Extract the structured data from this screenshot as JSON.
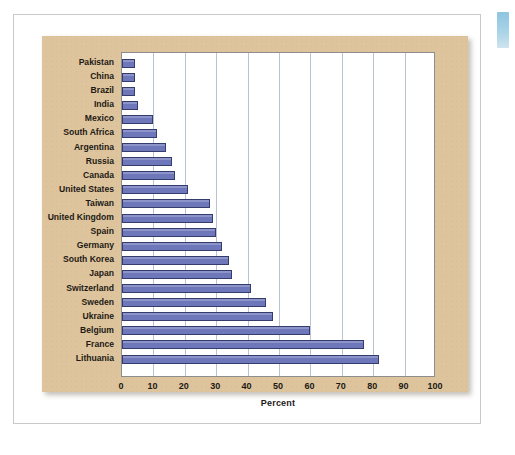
{
  "page": {
    "edge_tab_name": "page-edge-tab",
    "panel_color": "#ddc49c",
    "bar_color": "#6e77ba",
    "bar_border_color": "#343c6e",
    "gridline_color": "#b9c3d4",
    "plot_background": "#ffffff"
  },
  "chart_data": {
    "type": "bar",
    "orientation": "horizontal",
    "title": "",
    "subtitle": "",
    "xlabel": "Percent",
    "ylabel": "",
    "xlim": [
      0,
      100
    ],
    "xticks": [
      0,
      10,
      20,
      30,
      40,
      50,
      60,
      70,
      80,
      90,
      100
    ],
    "xtick_labels": [
      "0",
      "10",
      "20",
      "30",
      "40",
      "50",
      "60",
      "70",
      "80",
      "90",
      "100"
    ],
    "grid": "vertical",
    "legend": "none",
    "categories": [
      "Pakistan",
      "China",
      "Brazil",
      "India",
      "Mexico",
      "South Africa",
      "Argentina",
      "Russia",
      "Canada",
      "United States",
      "Taiwan",
      "United Kingdom",
      "Spain",
      "Germany",
      "South Korea",
      "Japan",
      "Switzerland",
      "Sweden",
      "Ukraine",
      "Belgium",
      "France",
      "Lithuania"
    ],
    "values": [
      4,
      4,
      4,
      5,
      10,
      11,
      14,
      16,
      17,
      21,
      28,
      29,
      30,
      32,
      34,
      35,
      41,
      46,
      48,
      60,
      77,
      82
    ]
  }
}
